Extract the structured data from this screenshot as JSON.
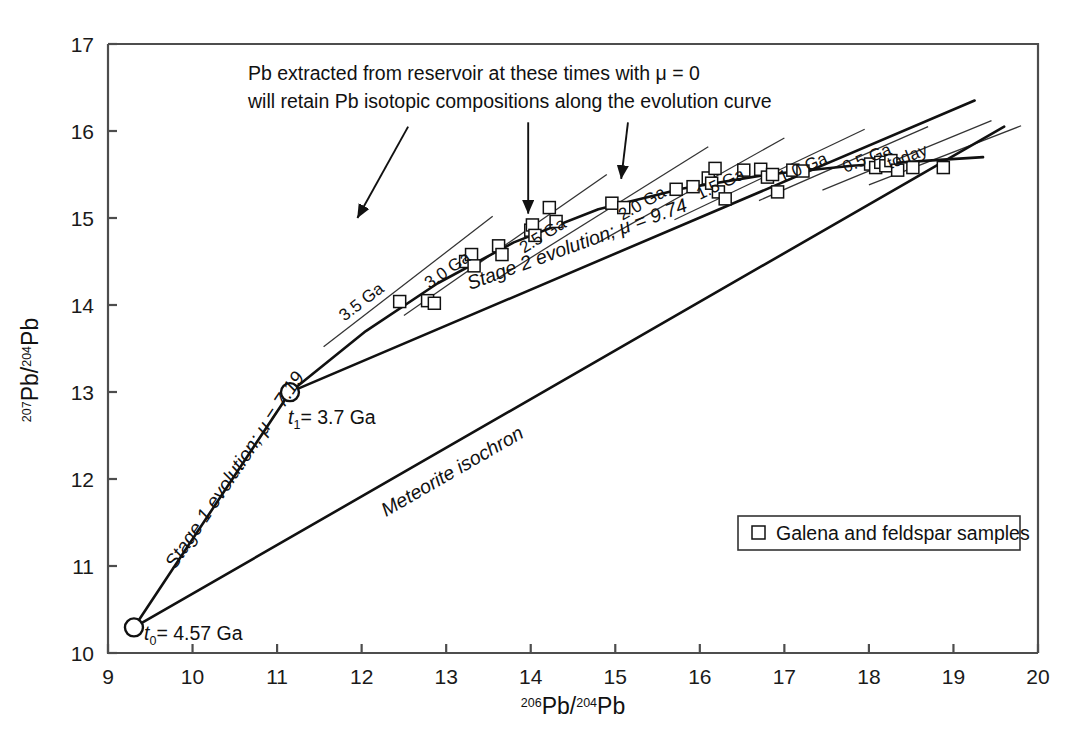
{
  "chart_data": {
    "type": "scatter",
    "title": "",
    "xlabel": "206Pb/204Pb",
    "ylabel": "207Pb/204Pb",
    "xlabel_parts": {
      "sup": "206",
      "base": "Pb/",
      "sup2": "204",
      "base2": "Pb"
    },
    "ylabel_parts": {
      "sup": "207",
      "base": "Pb/",
      "sup2": "204",
      "base2": "Pb"
    },
    "xlim": [
      9,
      20
    ],
    "ylim": [
      10,
      17
    ],
    "xticks": [
      9,
      10,
      11,
      12,
      13,
      14,
      15,
      16,
      17,
      18,
      19,
      20
    ],
    "yticks": [
      10,
      11,
      12,
      13,
      14,
      15,
      16,
      17
    ],
    "grid": false,
    "legend_position": "lower-right",
    "legend": [
      {
        "label": "Galena and feldspar samples",
        "marker": "open-square"
      }
    ],
    "series": [
      {
        "name": "Galena and feldspar samples",
        "marker": "open-square",
        "points": [
          [
            12.45,
            14.04
          ],
          [
            12.78,
            14.05
          ],
          [
            12.86,
            14.02
          ],
          [
            13.23,
            14.5
          ],
          [
            13.3,
            14.58
          ],
          [
            13.33,
            14.45
          ],
          [
            13.62,
            14.68
          ],
          [
            13.66,
            14.58
          ],
          [
            14.0,
            14.86
          ],
          [
            14.02,
            14.92
          ],
          [
            14.05,
            14.8
          ],
          [
            14.22,
            15.12
          ],
          [
            14.3,
            14.96
          ],
          [
            14.96,
            15.17
          ],
          [
            15.1,
            15.12
          ],
          [
            15.72,
            15.33
          ],
          [
            15.92,
            15.36
          ],
          [
            16.1,
            15.46
          ],
          [
            16.14,
            15.4
          ],
          [
            16.18,
            15.57
          ],
          [
            16.22,
            15.3
          ],
          [
            16.3,
            15.22
          ],
          [
            16.52,
            15.55
          ],
          [
            16.72,
            15.56
          ],
          [
            16.8,
            15.47
          ],
          [
            16.86,
            15.5
          ],
          [
            16.92,
            15.3
          ],
          [
            17.1,
            15.55
          ],
          [
            17.22,
            15.54
          ],
          [
            18.02,
            15.62
          ],
          [
            18.08,
            15.58
          ],
          [
            18.14,
            15.64
          ],
          [
            18.2,
            15.6
          ],
          [
            18.26,
            15.66
          ],
          [
            18.34,
            15.55
          ],
          [
            18.52,
            15.58
          ],
          [
            18.88,
            15.58
          ]
        ]
      }
    ],
    "nodes": [
      {
        "name": "t0",
        "label": "t0 = 4.57 Ga",
        "x": 9.307,
        "y": 10.294
      },
      {
        "name": "t1",
        "label": "t1 = 3.7 Ga",
        "x": 11.152,
        "y": 12.998
      }
    ],
    "curves": [
      {
        "name": "stage-1-evolution",
        "label": "Stage 1 evolution; μ = 7.19",
        "points": [
          [
            9.307,
            10.294
          ],
          [
            11.152,
            12.998
          ]
        ]
      },
      {
        "name": "stage-2-evolution",
        "label": "Stage 2 evolution; μ = 9.74",
        "points": [
          [
            11.152,
            12.998
          ],
          [
            12.05,
            13.7
          ],
          [
            12.9,
            14.25
          ],
          [
            13.8,
            14.72
          ],
          [
            14.8,
            15.1
          ],
          [
            15.8,
            15.34
          ],
          [
            16.8,
            15.5
          ],
          [
            17.8,
            15.6
          ],
          [
            18.7,
            15.66
          ],
          [
            19.35,
            15.7
          ]
        ]
      },
      {
        "name": "meteorite-isochron",
        "label": "Meteorite isochron",
        "points": [
          [
            9.307,
            10.294
          ],
          [
            19.6,
            16.05
          ]
        ]
      },
      {
        "name": "secondary-growth-line",
        "label": "",
        "points": [
          [
            11.152,
            12.998
          ],
          [
            19.25,
            16.35
          ]
        ]
      }
    ],
    "isochrons": [
      {
        "label": "3.5 Ga",
        "x1": 11.55,
        "y1": 13.52,
        "x2": 13.55,
        "y2": 15.02
      },
      {
        "label": "3.0 Ga",
        "x1": 12.5,
        "y1": 13.88,
        "x2": 14.9,
        "y2": 15.5
      },
      {
        "label": "2.5 Ga",
        "x1": 13.6,
        "y1": 14.3,
        "x2": 16.1,
        "y2": 15.82
      },
      {
        "label": "2.0 Ga",
        "x1": 14.8,
        "y1": 14.72,
        "x2": 17.0,
        "y2": 15.92
      },
      {
        "label": "1.5 Ga",
        "x1": 15.7,
        "y1": 14.98,
        "x2": 17.95,
        "y2": 16.02
      },
      {
        "label": "1.0 Ga",
        "x1": 16.7,
        "y1": 15.2,
        "x2": 18.7,
        "y2": 16.05
      },
      {
        "label": "0.5 Ga",
        "x1": 17.45,
        "y1": 15.32,
        "x2": 19.45,
        "y2": 16.12
      },
      {
        "label": "today",
        "x1": 18.0,
        "y1": 15.38,
        "x2": 19.8,
        "y2": 16.06
      }
    ],
    "caption": {
      "line1": "Pb extracted from reservoir at these times with μ = 0",
      "line2": "will retain Pb isotopic compositions along the evolution curve"
    },
    "caption_arrows": [
      {
        "name": "arrow-to-3-5-ga",
        "x1": 12.55,
        "y1": 16.05,
        "x2": 11.95,
        "y2": 15.0
      },
      {
        "name": "arrow-to-3-0-ga",
        "x1": 13.97,
        "y1": 16.1,
        "x2": 13.97,
        "y2": 15.05
      },
      {
        "name": "arrow-to-2-5-ga",
        "x1": 15.15,
        "y1": 16.1,
        "x2": 15.07,
        "y2": 15.45
      }
    ],
    "annotations": [
      {
        "name": "stage-1-label",
        "text": "Stage 1 evolution; μ = 7.19"
      },
      {
        "name": "stage-2-label",
        "text": "Stage 2 evolution; μ = 9.74"
      },
      {
        "name": "meteorite-isochron-label",
        "text": "Meteorite isochron"
      },
      {
        "name": "t0-label",
        "text": "t0 = 4.57 Ga"
      },
      {
        "name": "t1-label",
        "text": "t1 = 3.7 Ga"
      }
    ]
  },
  "axes": {
    "x_tick_labels": [
      "9",
      "10",
      "11",
      "12",
      "13",
      "14",
      "15",
      "16",
      "17",
      "18",
      "19",
      "20"
    ],
    "y_tick_labels": [
      "10",
      "11",
      "12",
      "13",
      "14",
      "15",
      "16",
      "17"
    ]
  },
  "labels": {
    "isochron_3_5": "3.5 Ga",
    "isochron_3_0": "3.0 Ga",
    "isochron_2_5": "2.5 Ga",
    "isochron_2_0": "2.0 Ga",
    "isochron_1_5": "1.5 Ga",
    "isochron_1_0": "1.0 Ga",
    "isochron_0_5": "0.5 Ga",
    "isochron_today": "today",
    "stage1": "Stage 1 evolution; μ = 7.19",
    "stage2": "Stage 2 evolution; μ = 9.74",
    "meteorite": "Meteorite isochron",
    "t0_t": "t",
    "t0_sub": "0",
    "t0_rest": "= 4.57 Ga",
    "t1_t": "t",
    "t1_sub": "1",
    "t1_rest": "= 3.7 Ga",
    "caption_line1": "Pb extracted from reservoir at these times with μ = 0",
    "caption_line2": "will retain Pb isotopic compositions along the evolution curve",
    "legend_text": "Galena and feldspar samples",
    "xaxis_sup1": "206",
    "xaxis_mid": "Pb/",
    "xaxis_sup2": "204",
    "xaxis_end": "Pb",
    "yaxis_sup1": "207",
    "yaxis_mid": "Pb/",
    "yaxis_sup2": "204",
    "yaxis_end": "Pb"
  },
  "colors": {
    "background": "#ffffff",
    "axis": "#4d4d4d",
    "curve": "#111111",
    "isochron": "#333333",
    "marker_fill": "#ffffff",
    "text": "#111111"
  }
}
